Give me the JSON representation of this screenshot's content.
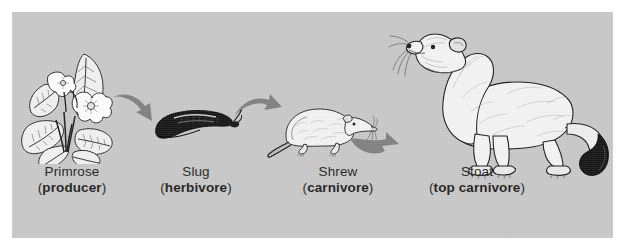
{
  "diagram": {
    "background_color": "#c9c9c9",
    "page_color": "#ffffff",
    "arrow_color": "#808080",
    "text_color": "#1d1d1d"
  },
  "organisms": [
    {
      "icon": "primrose-plant-icon",
      "name": "Primrose",
      "role": "producer",
      "role_open": "(",
      "role_close": ")"
    },
    {
      "icon": "slug-icon",
      "name": "Slug",
      "role": "herbivore",
      "role_open": "(",
      "role_close": ")"
    },
    {
      "icon": "shrew-icon",
      "name": "Shrew",
      "role": "carnivore",
      "role_open": "(",
      "role_close": ")"
    },
    {
      "icon": "stoat-icon",
      "name": "Stoat",
      "role": "top carnivore",
      "role_open": "(",
      "role_close": ")"
    }
  ],
  "arrows": [
    {
      "icon": "curved-arrow-right-icon",
      "from": "Primrose",
      "to": "Slug"
    },
    {
      "icon": "curved-arrow-right-icon",
      "from": "Slug",
      "to": "Shrew"
    },
    {
      "icon": "curved-arrow-right-icon",
      "from": "Shrew",
      "to": "Stoat"
    }
  ]
}
